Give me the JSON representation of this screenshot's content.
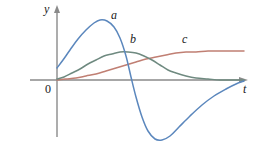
{
  "figure": {
    "background_color": "#ffffff",
    "axes": {
      "y_axis_label": "y",
      "x_axis_label": "t",
      "origin_label": "0",
      "axis_color": "#808080",
      "origin_x": 57,
      "origin_y": 80
    },
    "curve_labels": [
      {
        "name": "a",
        "text": "a",
        "x": 111,
        "y": 9
      },
      {
        "name": "b",
        "text": "b",
        "x": 130,
        "y": 33
      },
      {
        "name": "c",
        "text": "c",
        "x": 182,
        "y": 33
      }
    ]
  },
  "chart_data": {
    "type": "line",
    "title": "",
    "xlabel": "t",
    "ylabel": "y",
    "grid": false,
    "legend": "inline-curve-labels",
    "xlim": [
      0,
      240
    ],
    "ylim": [
      -70,
      70
    ],
    "series": [
      {
        "name": "a",
        "label": "a",
        "color": "#5b87bd",
        "description": "rises to a tall positive peak, crosses zero, dips to a deep negative trough, then returns toward zero",
        "points": [
          [
            57,
            68
          ],
          [
            63,
            60
          ],
          [
            70,
            50
          ],
          [
            78,
            39
          ],
          [
            86,
            30
          ],
          [
            94,
            23
          ],
          [
            100,
            20
          ],
          [
            107,
            21
          ],
          [
            114,
            27
          ],
          [
            120,
            38
          ],
          [
            126,
            56
          ],
          [
            131,
            77
          ],
          [
            136,
            97
          ],
          [
            142,
            117
          ],
          [
            148,
            131
          ],
          [
            155,
            139
          ],
          [
            162,
            140
          ],
          [
            170,
            136
          ],
          [
            179,
            127
          ],
          [
            190,
            116
          ],
          [
            202,
            105
          ],
          [
            214,
            96
          ],
          [
            226,
            89
          ],
          [
            236,
            84
          ],
          [
            244,
            81
          ]
        ]
      },
      {
        "name": "b",
        "label": "b",
        "color": "#6f8a80",
        "description": "rises smoothly to a broad low hump then decays back toward the axis",
        "points": [
          [
            57,
            79
          ],
          [
            64,
            77
          ],
          [
            72,
            73
          ],
          [
            80,
            69
          ],
          [
            88,
            64
          ],
          [
            96,
            60
          ],
          [
            104,
            56
          ],
          [
            112,
            54
          ],
          [
            120,
            52
          ],
          [
            128,
            52
          ],
          [
            136,
            53
          ],
          [
            144,
            56
          ],
          [
            152,
            60
          ],
          [
            160,
            65
          ],
          [
            168,
            70
          ],
          [
            176,
            73
          ],
          [
            186,
            76
          ],
          [
            196,
            78
          ],
          [
            208,
            79
          ],
          [
            220,
            80
          ],
          [
            232,
            80
          ],
          [
            244,
            80
          ]
        ]
      },
      {
        "name": "c",
        "label": "c",
        "color": "#c07f73",
        "description": "slowly increasing curve that levels off at a constant positive value",
        "points": [
          [
            57,
            80
          ],
          [
            66,
            79
          ],
          [
            76,
            78
          ],
          [
            86,
            76
          ],
          [
            96,
            74
          ],
          [
            106,
            71
          ],
          [
            116,
            68
          ],
          [
            126,
            65
          ],
          [
            136,
            62
          ],
          [
            146,
            59
          ],
          [
            156,
            57
          ],
          [
            166,
            55
          ],
          [
            176,
            53
          ],
          [
            186,
            52
          ],
          [
            196,
            52
          ],
          [
            208,
            51
          ],
          [
            220,
            51
          ],
          [
            232,
            51
          ],
          [
            244,
            51
          ]
        ]
      }
    ]
  }
}
